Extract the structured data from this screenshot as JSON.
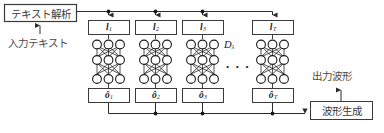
{
  "figure": {
    "width": 384,
    "height": 133,
    "background": "#ffffff",
    "line_color": "#3a3a3a",
    "text_color": "#4a4a4a",
    "math_color": "#1a1a1a"
  },
  "blocks": {
    "text_analysis": {
      "label": "テキスト解析",
      "x": 4,
      "y": 4,
      "w": 72,
      "h": 17
    },
    "waveform_generation": {
      "label": "波形生成",
      "x": 310,
      "y": 101,
      "w": 62,
      "h": 18
    }
  },
  "annotations": {
    "input_text": {
      "label": "入力テキスト",
      "x": 8,
      "y": 38
    },
    "output_waveform": {
      "label": "出力波形",
      "x": 314,
      "y": 72
    },
    "model_symbol": {
      "label": "D",
      "subscript": "λ",
      "x": 225,
      "y": 40
    },
    "horizontal_ellipsis": {
      "label": "• • •",
      "x": 224,
      "y": 66
    }
  },
  "linguistic_boxes": [
    {
      "symbol": "l",
      "subscript": "1",
      "x": 88,
      "y": 20,
      "w": 41,
      "h": 14
    },
    {
      "symbol": "l",
      "subscript": "2",
      "x": 135,
      "y": 20,
      "w": 41,
      "h": 14
    },
    {
      "symbol": "l",
      "subscript": "3",
      "x": 182,
      "y": 20,
      "w": 41,
      "h": 14
    },
    {
      "symbol": "l",
      "subscript": "T",
      "x": 252,
      "y": 20,
      "w": 41,
      "h": 14
    }
  ],
  "output_boxes": [
    {
      "symbol": "ô",
      "subscript": "1",
      "x": 88,
      "y": 88,
      "w": 41,
      "h": 14
    },
    {
      "symbol": "ô",
      "subscript": "2",
      "x": 135,
      "y": 88,
      "w": 41,
      "h": 14
    },
    {
      "symbol": "ô",
      "subscript": "3",
      "x": 182,
      "y": 88,
      "w": 41,
      "h": 14
    },
    {
      "symbol": "ô",
      "subscript": "T",
      "x": 252,
      "y": 88,
      "w": 41,
      "h": 14
    }
  ],
  "networks": [
    {
      "id": "net-1",
      "cx": 108.5,
      "nodes_per_layer": 3,
      "layers": 3
    },
    {
      "id": "net-2",
      "cx": 155.5,
      "nodes_per_layer": 3,
      "layers": 3
    },
    {
      "id": "net-3",
      "cx": 202.5,
      "nodes_per_layer": 3,
      "layers": 3
    },
    {
      "id": "net-4",
      "cx": 272.5,
      "nodes_per_layer": 3,
      "layers": 3
    }
  ],
  "connectors": {
    "top_bus_y": 11,
    "bottom_bus_y": 113,
    "junction_dots_top": [
      108.5,
      155.5,
      202.5
    ],
    "junction_dots_bottom": [
      108.5,
      155.5,
      202.5
    ]
  }
}
